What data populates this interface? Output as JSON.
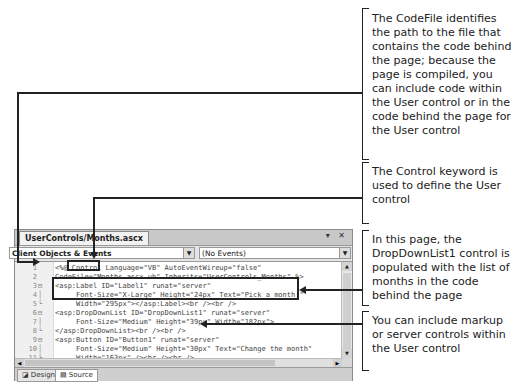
{
  "editor": {
    "document_tab": "UserControls/Months.ascx",
    "window_buttons": "▾ ✕",
    "object_combo": "Client Objects & Events",
    "event_combo": "(No Events)",
    "code_lines": [
      {
        "n": "1",
        "fold": "",
        "text": "<%@ Control Language=\"VB\" AutoEventWireup=\"false\""
      },
      {
        "n": "2",
        "fold": "",
        "text": "CodeFile=\"Months.ascx.vb\" Inherits=\"UserControls_Months\" %>"
      },
      {
        "n": "3",
        "fold": "⊟",
        "text": "<asp:Label ID=\"Label1\" runat=\"server\""
      },
      {
        "n": "4",
        "fold": "│",
        "text": "     Font-Size=\"X-Large\" Height=\"24px\" Text=\"Pick a month:\""
      },
      {
        "n": "5",
        "fold": "└",
        "text": "     Width=\"295px\"></asp:Label><br /><br />"
      },
      {
        "n": "6",
        "fold": "⊟",
        "text": "<asp:DropDownList ID=\"DropDownList1\" runat=\"server\""
      },
      {
        "n": "7",
        "fold": "│",
        "text": "     Font-Size=\"Medium\" Height=\"39px\" Width=\"182px\">"
      },
      {
        "n": "8",
        "fold": "└",
        "text": "</asp:DropDownList><br /><br />"
      },
      {
        "n": "9",
        "fold": "⊟",
        "text": "<asp:Button ID=\"Button1\" runat=\"server\""
      },
      {
        "n": "10",
        "fold": "│",
        "text": "     Font-Size=\"Medium\" Height=\"30px\" Text=\"Change the month\""
      },
      {
        "n": "11",
        "fold": "└",
        "text": "     Width=\"163px\" /><br /><br />"
      },
      {
        "n": "12",
        "fold": "",
        "text": "<asp:Label ID=\"Label2\" runat=\"server\""
      },
      {
        "n": "13",
        "fold": "",
        "text": "     Font-Size=\"Large\" Text=\"January\" Width=\"283px\" />"
      }
    ],
    "view_tabs": {
      "design": "Design",
      "source": "Source"
    }
  },
  "callouts": [
    {
      "text": "The CodeFile identifies the path to the file that contains the code behind the page; because the page is compiled, you can include code within the User control or in the code behind the page for the User control"
    },
    {
      "text": "The Control keyword is used to define the User control"
    },
    {
      "text": "In this page, the DropDownList1 control is populated with the list of months in the code behind the page"
    },
    {
      "text": "You can include markup or server controls within the User control"
    }
  ]
}
